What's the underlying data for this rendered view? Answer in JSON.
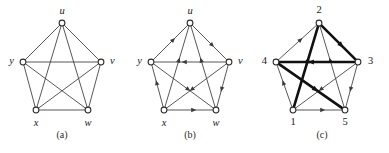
{
  "figure": {
    "background_color": "#ffffff",
    "thin_edge_color": "#3a3a3a",
    "bold_edge_color": "#111111",
    "node_fill": "#ffffff",
    "node_stroke": "#2b2b2b",
    "label_color": "#1a1a1a"
  },
  "panels": [
    {
      "id": "a",
      "caption": "(a)",
      "caption_x": 62,
      "caption_y": 138,
      "type": "undirected-complete-graph",
      "directed": false,
      "center_x": 62,
      "center_y": 67,
      "nodes": [
        {
          "id": "u",
          "label": "u",
          "x": 62,
          "y": 23,
          "label_x": 62,
          "label_y": 12,
          "label_anchor": "middle"
        },
        {
          "id": "v",
          "label": "v",
          "x": 101,
          "y": 62,
          "label_x": 110,
          "label_y": 62,
          "label_anchor": "start"
        },
        {
          "id": "w",
          "label": "w",
          "x": 88,
          "y": 110,
          "label_x": 88,
          "label_y": 124,
          "label_anchor": "middle"
        },
        {
          "id": "x",
          "label": "x",
          "x": 36,
          "y": 110,
          "label_x": 36,
          "label_y": 124,
          "label_anchor": "middle"
        },
        {
          "id": "y",
          "label": "y",
          "x": 23,
          "y": 62,
          "label_x": 14,
          "label_y": 62,
          "label_anchor": "end"
        }
      ],
      "edges": [
        {
          "from": "u",
          "to": "v",
          "bold": false,
          "arrow": false
        },
        {
          "from": "v",
          "to": "w",
          "bold": false,
          "arrow": false
        },
        {
          "from": "w",
          "to": "x",
          "bold": false,
          "arrow": false
        },
        {
          "from": "x",
          "to": "y",
          "bold": false,
          "arrow": false
        },
        {
          "from": "y",
          "to": "u",
          "bold": false,
          "arrow": false
        },
        {
          "from": "u",
          "to": "w",
          "bold": false,
          "arrow": false
        },
        {
          "from": "u",
          "to": "x",
          "bold": false,
          "arrow": false
        },
        {
          "from": "v",
          "to": "x",
          "bold": false,
          "arrow": false
        },
        {
          "from": "v",
          "to": "y",
          "bold": false,
          "arrow": false
        },
        {
          "from": "w",
          "to": "y",
          "bold": false,
          "arrow": false
        }
      ]
    },
    {
      "id": "b",
      "caption": "(b)",
      "caption_x": 190,
      "caption_y": 138,
      "type": "directed-tournament-graph",
      "directed": true,
      "center_x": 190,
      "center_y": 67,
      "nodes": [
        {
          "id": "u",
          "label": "u",
          "x": 190,
          "y": 23,
          "label_x": 190,
          "label_y": 12,
          "label_anchor": "middle"
        },
        {
          "id": "v",
          "label": "v",
          "x": 229,
          "y": 62,
          "label_x": 238,
          "label_y": 62,
          "label_anchor": "start"
        },
        {
          "id": "w",
          "label": "w",
          "x": 216,
          "y": 110,
          "label_x": 216,
          "label_y": 124,
          "label_anchor": "middle"
        },
        {
          "id": "x",
          "label": "x",
          "x": 164,
          "y": 110,
          "label_x": 164,
          "label_y": 124,
          "label_anchor": "middle"
        },
        {
          "id": "y",
          "label": "y",
          "x": 151,
          "y": 62,
          "label_x": 142,
          "label_y": 62,
          "label_anchor": "end"
        }
      ],
      "edges": [
        {
          "from": "y",
          "to": "u",
          "bold": false,
          "arrow": true
        },
        {
          "from": "u",
          "to": "v",
          "bold": false,
          "arrow": true
        },
        {
          "from": "v",
          "to": "w",
          "bold": false,
          "arrow": true
        },
        {
          "from": "x",
          "to": "w",
          "bold": false,
          "arrow": true
        },
        {
          "from": "x",
          "to": "y",
          "bold": false,
          "arrow": true
        },
        {
          "from": "v",
          "to": "y",
          "bold": false,
          "arrow": true
        },
        {
          "from": "x",
          "to": "u",
          "bold": false,
          "arrow": true
        },
        {
          "from": "w",
          "to": "u",
          "bold": false,
          "arrow": true
        },
        {
          "from": "v",
          "to": "x",
          "bold": false,
          "arrow": true
        },
        {
          "from": "y",
          "to": "w",
          "bold": false,
          "arrow": true
        }
      ]
    },
    {
      "id": "c",
      "caption": "(c)",
      "caption_x": 322,
      "caption_y": 138,
      "type": "directed-tournament-graph-highlighted",
      "directed": true,
      "center_x": 319,
      "center_y": 67,
      "nodes": [
        {
          "id": "2",
          "label": "2",
          "x": 319,
          "y": 23,
          "label_x": 319,
          "label_y": 11,
          "label_anchor": "middle"
        },
        {
          "id": "3",
          "label": "3",
          "x": 358,
          "y": 62,
          "label_x": 368,
          "label_y": 62,
          "label_anchor": "start"
        },
        {
          "id": "5",
          "label": "5",
          "x": 345,
          "y": 110,
          "label_x": 345,
          "label_y": 123,
          "label_anchor": "middle"
        },
        {
          "id": "1",
          "label": "1",
          "x": 293,
          "y": 110,
          "label_x": 293,
          "label_y": 123,
          "label_anchor": "middle"
        },
        {
          "id": "4",
          "label": "4",
          "x": 276,
          "y": 62,
          "label_x": 267,
          "label_y": 62,
          "label_anchor": "end"
        }
      ],
      "edges": [
        {
          "from": "4",
          "to": "2",
          "bold": false,
          "arrow": true
        },
        {
          "from": "2",
          "to": "3",
          "bold": true,
          "arrow": true
        },
        {
          "from": "3",
          "to": "5",
          "bold": false,
          "arrow": true
        },
        {
          "from": "1",
          "to": "5",
          "bold": false,
          "arrow": true
        },
        {
          "from": "1",
          "to": "4",
          "bold": false,
          "arrow": true
        },
        {
          "from": "3",
          "to": "4",
          "bold": true,
          "arrow": true
        },
        {
          "from": "1",
          "to": "2",
          "bold": true,
          "arrow": true
        },
        {
          "from": "5",
          "to": "2",
          "bold": false,
          "arrow": true
        },
        {
          "from": "3",
          "to": "1",
          "bold": false,
          "arrow": true
        },
        {
          "from": "4",
          "to": "5",
          "bold": true,
          "arrow": true
        }
      ],
      "highlighted_cycle": [
        "1",
        "2",
        "3",
        "4",
        "5"
      ]
    }
  ]
}
